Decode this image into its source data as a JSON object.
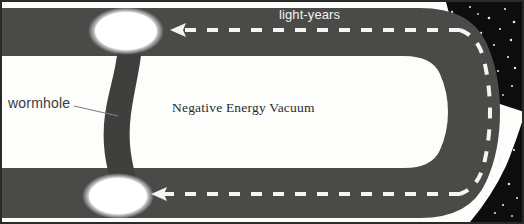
{
  "figure": {
    "width": 524,
    "height": 224
  },
  "labels": {
    "light_years": "light-years",
    "wormhole": "wormhole",
    "negative_energy_vacuum": "Negative Energy Vacuum"
  },
  "colors": {
    "spacetime_band": "#4a4a48",
    "spacetime_band_dark": "#3d3d3b",
    "vacuum_white": "#fdfdfc",
    "starfield_black": "#0d0d0d",
    "star_white": "#e8e8e6",
    "dash_white": "#f5f5f3",
    "mouth_glow": "#ffffff",
    "border": "#2a2a28",
    "label_dark": "#2b2b2b",
    "label_light": "#f2f2f0"
  },
  "elements": {
    "top_band": "upper-spacetime-sheet",
    "bottom_band": "lower-spacetime-sheet",
    "fold": "right-hand-fold",
    "vacuum_region": "negative-energy-vacuum-region",
    "throat": "wormhole-throat",
    "top_mouth": "upper-wormhole-mouth",
    "bottom_mouth": "lower-wormhole-mouth",
    "dashed_path": "light-travel-path",
    "leader_line": "wormhole-leader-line",
    "arrowhead_top": "upper-path-arrowhead",
    "arrowhead_bottom": "lower-path-arrowhead"
  },
  "stars": {
    "top_right": [
      [
        452,
        12
      ],
      [
        470,
        7
      ],
      [
        489,
        18
      ],
      [
        505,
        9
      ],
      [
        463,
        27
      ],
      [
        481,
        33
      ],
      [
        500,
        29
      ],
      [
        514,
        22
      ],
      [
        457,
        44
      ],
      [
        474,
        50
      ],
      [
        494,
        45
      ],
      [
        511,
        40
      ],
      [
        466,
        63
      ],
      [
        487,
        60
      ],
      [
        508,
        57
      ],
      [
        498,
        71
      ],
      [
        515,
        68
      ],
      [
        478,
        14
      ],
      [
        512,
        86
      ],
      [
        503,
        95
      ]
    ],
    "bottom_right": [
      [
        500,
        160
      ],
      [
        514,
        150
      ],
      [
        492,
        176
      ],
      [
        509,
        184
      ],
      [
        486,
        196
      ],
      [
        503,
        205
      ],
      [
        517,
        198
      ],
      [
        495,
        213
      ],
      [
        512,
        216
      ],
      [
        478,
        208
      ]
    ]
  }
}
